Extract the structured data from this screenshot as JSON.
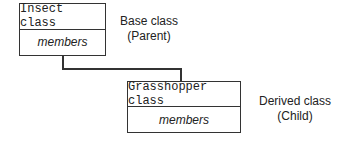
{
  "diagram": {
    "base": {
      "name": "Insect class",
      "members": "members",
      "label_line1": "Base class",
      "label_line2": "(Parent)"
    },
    "derived": {
      "name": "Grasshopper class",
      "members": "members",
      "label_line1": "Derived class",
      "label_line2": "(Child)"
    }
  }
}
